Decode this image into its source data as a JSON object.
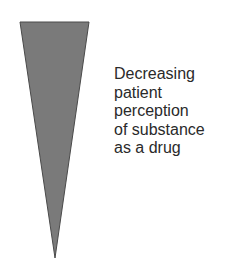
{
  "diagram": {
    "shape": "inverted-triangle-wedge",
    "fill_color": "#7a7a7a",
    "stroke_color": "#4a4a4a",
    "label_lines": [
      "Decreasing",
      "patient",
      "perception",
      "of substance",
      "as a drug"
    ]
  }
}
